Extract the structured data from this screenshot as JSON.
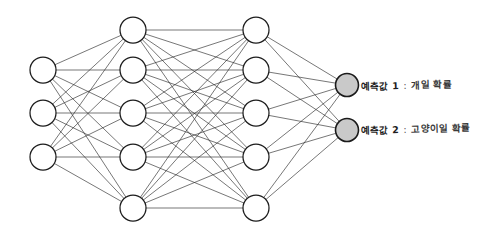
{
  "diagram": {
    "kind": "neural-network-diagram",
    "title": "",
    "background_color": "#ffffff",
    "edge_color": "#2b2b2b",
    "node_outline_color": "#1d1d1d",
    "node_fill_default": "#ffffff",
    "output_node_fill": "#c9c9c9",
    "layers": [
      {
        "id": "input",
        "name": "input-layer",
        "node_count": 3,
        "cx": 43,
        "radius": 13,
        "fill": "#ffffff",
        "node_ys": [
          70,
          113,
          157
        ]
      },
      {
        "id": "hidden1",
        "name": "hidden-layer-1",
        "node_count": 5,
        "cx": 133,
        "radius": 13,
        "fill": "#ffffff",
        "node_ys": [
          30,
          70,
          113,
          157,
          208
        ]
      },
      {
        "id": "hidden2",
        "name": "hidden-layer-2",
        "node_count": 5,
        "cx": 256,
        "radius": 13,
        "fill": "#ffffff",
        "node_ys": [
          30,
          70,
          113,
          157,
          208
        ]
      },
      {
        "id": "output",
        "name": "output-layer",
        "node_count": 2,
        "cx": 347,
        "radius": 11.5,
        "fill": "#c9c9c9",
        "node_ys": [
          85,
          130
        ]
      }
    ],
    "connections": [
      {
        "from": "input",
        "to": "hidden1",
        "type": "fully-connected"
      },
      {
        "from": "hidden1",
        "to": "hidden2",
        "type": "fully-connected"
      },
      {
        "from": "hidden2",
        "to": "output",
        "type": "fully-connected"
      }
    ],
    "output_labels": [
      {
        "id": "pred-1",
        "name": "예측값 1",
        "separator": ":",
        "description": "개일 확률",
        "full_text": "예측값 1 : 개일 확률"
      },
      {
        "id": "pred-2",
        "name": "예측값 2",
        "separator": ":",
        "description": "고양이일 확률",
        "full_text": "예측값 2 : 고양이일 확률"
      }
    ]
  }
}
